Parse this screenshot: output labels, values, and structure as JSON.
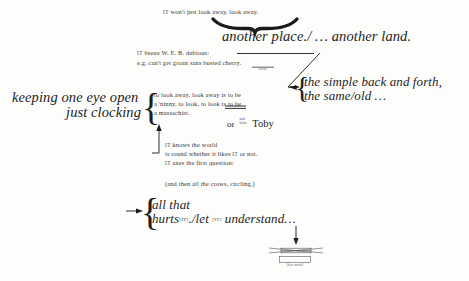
{
  "document": {
    "type": "annotated-manuscript-page",
    "background_color": "#fdfdfc",
    "ink_color": "#2b2b2b"
  },
  "lines": {
    "top_body": "IT won't just look away, look away.",
    "display_another": "another place./ … another land.",
    "beeze": "IT beeze W. E. B. dubious:",
    "eg": "e.g. can't get groan sans busted cherry.",
    "display_left_1": "keeping one eye open",
    "display_left_2": "just clocking",
    "mid_body_1": "to look away, look away is to be",
    "mid_body_2": "a 'ninny, to look, to look is to be",
    "mid_body_3": "a massachist.",
    "display_right_1": "the simple back and forth,",
    "display_right_2": "the same/old …",
    "or_toby_prefix": "or",
    "or_toby_name": "Toby",
    "lower_body_1": "IT knows the world",
    "lower_body_2": "is round whether it likes IT or not.",
    "lower_body_3": "IT axes the first question:",
    "crows": "(and then all the crows, circling.)",
    "display_bottom_1": "all that",
    "display_bottom_2a": "hurts",
    "display_bottom_2b": "./let",
    "display_bottom_2c": "understand…"
  },
  "small_caps": {
    "it": "IT",
    "it_bracketed": "[IT]"
  },
  "annotations": {
    "cherry_note": "cooke",
    "toby_super_1": "and",
    "toby_super_2": "kinte",
    "strike_note": "inset caption",
    "strike_subnote": "(how much)"
  },
  "marks": {
    "curly_brace": "{",
    "convergence_brace": "brace-under-look-away",
    "arrow_to_right_block": "diagonal-arrow",
    "arrow_to_mid_block": "up-arrow",
    "arrow_to_bottom_block": "right-arrow",
    "arrow_down_final": "down-arrow",
    "strikethrough": "strikethrough-line"
  }
}
